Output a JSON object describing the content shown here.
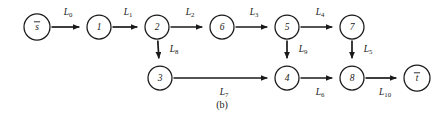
{
  "figure": {
    "caption": "(b)",
    "width": 445,
    "height": 121,
    "background_color": "#ffffff",
    "ink_color": "#1a1a1a"
  },
  "nodes": [
    {
      "id": "s",
      "label": "s",
      "overbar": true,
      "cx": 37,
      "cy": 27,
      "r": 13
    },
    {
      "id": "1",
      "label": "1",
      "overbar": false,
      "cx": 99,
      "cy": 27,
      "r": 12
    },
    {
      "id": "2",
      "label": "2",
      "overbar": false,
      "cx": 157,
      "cy": 27,
      "r": 12
    },
    {
      "id": "6",
      "label": "6",
      "overbar": false,
      "cx": 222,
      "cy": 27,
      "r": 12
    },
    {
      "id": "5",
      "label": "5",
      "overbar": false,
      "cx": 287,
      "cy": 27,
      "r": 12
    },
    {
      "id": "7",
      "label": "7",
      "overbar": false,
      "cx": 352,
      "cy": 27,
      "r": 12
    },
    {
      "id": "3",
      "label": "3",
      "overbar": false,
      "cx": 160,
      "cy": 78,
      "r": 12
    },
    {
      "id": "4",
      "label": "4",
      "overbar": false,
      "cx": 287,
      "cy": 78,
      "r": 12
    },
    {
      "id": "8",
      "label": "8",
      "overbar": false,
      "cx": 352,
      "cy": 78,
      "r": 12
    },
    {
      "id": "t",
      "label": "t",
      "overbar": true,
      "cx": 417,
      "cy": 78,
      "r": 13
    }
  ],
  "edges": [
    {
      "id": "L0",
      "from": "s",
      "to": "1",
      "label_base": "L",
      "label_sub": "0",
      "label_x": 68,
      "label_y": 13
    },
    {
      "id": "L1",
      "from": "1",
      "to": "2",
      "label_base": "L",
      "label_sub": "1",
      "label_x": 128,
      "label_y": 13
    },
    {
      "id": "L2",
      "from": "2",
      "to": "6",
      "label_base": "L",
      "label_sub": "2",
      "label_x": 190,
      "label_y": 13
    },
    {
      "id": "L3",
      "from": "6",
      "to": "5",
      "label_base": "L",
      "label_sub": "3",
      "label_x": 254,
      "label_y": 13
    },
    {
      "id": "L4",
      "from": "5",
      "to": "7",
      "label_base": "L",
      "label_sub": "4",
      "label_x": 320,
      "label_y": 13
    },
    {
      "id": "L8",
      "from": "2",
      "to": "3",
      "label_base": "L",
      "label_sub": "8",
      "label_x": 174,
      "label_y": 50
    },
    {
      "id": "L9",
      "from": "5",
      "to": "4",
      "label_base": "L",
      "label_sub": "9",
      "label_x": 303,
      "label_y": 50
    },
    {
      "id": "L5",
      "from": "7",
      "to": "8",
      "label_base": "L",
      "label_sub": "5",
      "label_x": 368,
      "label_y": 50
    },
    {
      "id": "L7",
      "from": "3",
      "to": "4",
      "label_base": "L",
      "label_sub": "7",
      "label_x": 224,
      "label_y": 93
    },
    {
      "id": "L6",
      "from": "4",
      "to": "8",
      "label_base": "L",
      "label_sub": "6",
      "label_x": 320,
      "label_y": 93
    },
    {
      "id": "L10",
      "from": "8",
      "to": "t",
      "label_base": "L",
      "label_sub": "10",
      "label_x": 385,
      "label_y": 93
    }
  ],
  "caption": {
    "text": "(b)",
    "x": 222,
    "y": 106
  }
}
